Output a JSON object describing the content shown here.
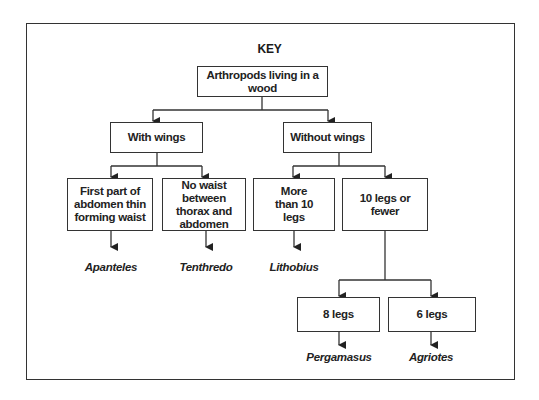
{
  "title": "KEY",
  "root": {
    "label": "Arthropods living in a wood"
  },
  "level1": [
    {
      "label": "With wings"
    },
    {
      "label": "Without wings"
    }
  ],
  "level2": [
    {
      "label": "First part of abdomen thin forming waist",
      "result": "Apanteles"
    },
    {
      "label": "No waist between thorax and abdomen",
      "result": "Tenthredo"
    },
    {
      "label": "More than 10 legs",
      "result": "Lithobius"
    },
    {
      "label": "10 legs or fewer"
    }
  ],
  "level3": [
    {
      "label": "8 legs",
      "result": "Pergamasus"
    },
    {
      "label": "6 legs",
      "result": "Agriotes"
    }
  ],
  "colors": {
    "line": "#333333",
    "text": "#222222",
    "background": "#ffffff"
  }
}
